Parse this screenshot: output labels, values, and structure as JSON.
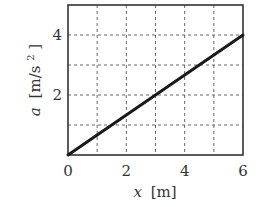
{
  "chart_data": {
    "type": "line",
    "title": "",
    "xlabel": "x [m]",
    "ylabel": "a [m/s^2]",
    "xlabel_parts": {
      "var": "x",
      "unit": "[m]"
    },
    "ylabel_parts": {
      "var": "a",
      "unit": "[m/s",
      "sup": "2",
      "close": "]"
    },
    "xlim": [
      0,
      6
    ],
    "ylim": [
      0,
      5
    ],
    "x_ticks": [
      "0",
      "2",
      "4",
      "6"
    ],
    "y_ticks": [
      "2",
      "4"
    ],
    "grid": true,
    "grid_style": "dashed",
    "x_grid": [
      1,
      2,
      3,
      4,
      5
    ],
    "y_grid": [
      1,
      2,
      3,
      4
    ],
    "series": [
      {
        "name": "a(x)",
        "x": [
          0,
          6
        ],
        "y": [
          0,
          4
        ],
        "color": "#1a1a1a"
      }
    ]
  },
  "colors": {
    "line": "#1a1a1a",
    "axes": "#333333",
    "grid": "#555555"
  }
}
